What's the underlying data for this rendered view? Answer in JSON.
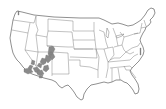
{
  "map": {
    "type": "choropleth",
    "region": "Contiguous United States",
    "boundaries": "state outlines",
    "highlighted_regions": [
      "Utah (south/central counties)",
      "Arizona (western/central counties)",
      "Nevada (southern counties)",
      "California (southeastern edge)"
    ],
    "colors": {
      "background": "#ffffff",
      "state_fill": "#ffffff",
      "state_border": "#555555",
      "highlight_fill": "#8a8a8a"
    }
  }
}
